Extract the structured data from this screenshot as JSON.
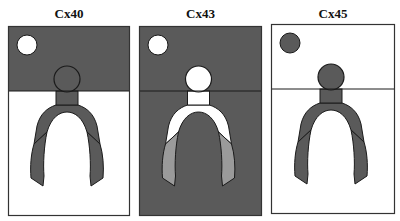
{
  "figure": {
    "panels": [
      {
        "label": "Cx40",
        "colors": {
          "top_bg": "#5a5a5a",
          "bottom_bg": "#ffffff",
          "indicator": "#ffffff",
          "head": "#5a5a5a",
          "stem": "#5a5a5a",
          "arch_upper": "#5a5a5a",
          "arch_lower": "#5a5a5a"
        }
      },
      {
        "label": "Cx43",
        "colors": {
          "top_bg": "#5a5a5a",
          "bottom_bg": "#5a5a5a",
          "indicator": "#ffffff",
          "head": "#ffffff",
          "stem": "#ffffff",
          "arch_upper": "#ffffff",
          "arch_lower": "#9a9a9a"
        }
      },
      {
        "label": "Cx45",
        "colors": {
          "top_bg": "#ffffff",
          "bottom_bg": "#ffffff",
          "indicator": "#5a5a5a",
          "head": "#5a5a5a",
          "stem": "#5a5a5a",
          "arch_upper": "#5a5a5a",
          "arch_lower": "#5a5a5a"
        }
      }
    ]
  }
}
